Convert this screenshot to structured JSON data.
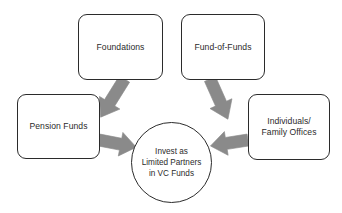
{
  "diagram": {
    "type": "flow-diagram",
    "background_color": "#ffffff",
    "node_border_color": "#2b2b2b",
    "arrow_color": "#8a8a8a",
    "text_color": "#2b2b2b",
    "nodes": [
      {
        "id": "foundations",
        "label": "Foundations",
        "shape": "rounded-rect"
      },
      {
        "id": "fund-of-funds",
        "label": "Fund-of-Funds",
        "shape": "rounded-rect"
      },
      {
        "id": "pension-funds",
        "label": "Pension Funds",
        "shape": "rounded-rect"
      },
      {
        "id": "individuals",
        "label": "Individuals/\nFamily Offices",
        "shape": "rounded-rect"
      },
      {
        "id": "center",
        "label": "Invest as\nLimited Partners\nin VC Funds",
        "shape": "circle"
      }
    ],
    "arrows": [
      {
        "id": "arrow-foundations-to-center",
        "from": "foundations",
        "to": "center",
        "direction": "down-right"
      },
      {
        "id": "arrow-fund-of-funds-to-center",
        "from": "fund-of-funds",
        "to": "center",
        "direction": "down-left"
      },
      {
        "id": "arrow-pension-funds-to-center",
        "from": "pension-funds",
        "to": "center",
        "direction": "right"
      },
      {
        "id": "arrow-individuals-to-center",
        "from": "individuals",
        "to": "center",
        "direction": "left"
      }
    ]
  }
}
